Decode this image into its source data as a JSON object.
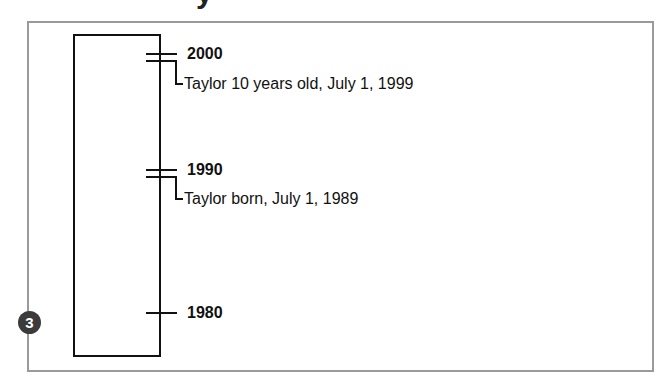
{
  "title_fragment": "y",
  "step_badge": "3",
  "timeline": {
    "ticks": [
      {
        "year": "2000"
      },
      {
        "year": "1990"
      },
      {
        "year": "1980"
      }
    ],
    "events": [
      {
        "label": "Taylor 10 years old, July 1, 1999"
      },
      {
        "label": "Taylor born, July 1, 1989"
      }
    ]
  },
  "colors": {
    "frame_border": "#9a9a9a",
    "line": "#111111",
    "badge_fill": "#3b3b3b",
    "badge_text": "#ffffff"
  }
}
